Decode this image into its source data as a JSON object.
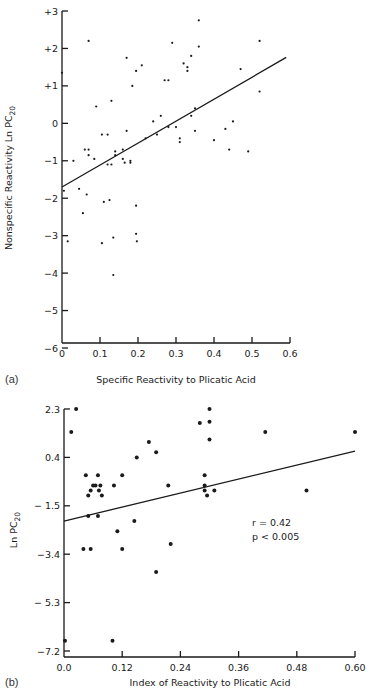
{
  "chart_data": [
    {
      "type": "scatter",
      "panel": "(a)",
      "title": "",
      "xlabel": "Specific Reactivity to Plicatic Acid",
      "ylabel": "Nonspecific Reactivity Ln PC20",
      "ylabel_main": "Nonspecific Reactivity Ln PC",
      "ylabel_sub": "20",
      "xlim": [
        0,
        0.6
      ],
      "ylim": [
        -6,
        3
      ],
      "x_ticks": [
        0,
        0.1,
        0.2,
        0.3,
        0.4,
        0.5,
        0.6
      ],
      "x_tick_labels": [
        "0",
        "0.1",
        "0.2",
        "0.3",
        "0.4",
        "0.5",
        "0.6"
      ],
      "y_ticks": [
        3,
        2,
        1,
        0,
        -1,
        -2,
        -3,
        -4,
        -5,
        -6
      ],
      "y_tick_labels": [
        "+3",
        "+2",
        "+1",
        "0",
        "−1",
        "−2",
        "−3",
        "−4",
        "−5",
        "−6"
      ],
      "grid": false,
      "fit_line": {
        "x": [
          0,
          0.59
        ],
        "y": [
          -1.7,
          1.76
        ]
      },
      "points": [
        {
          "x": 0.0,
          "y": 1.35
        },
        {
          "x": 0.07,
          "y": 2.2
        },
        {
          "x": 0.03,
          "y": -1.0
        },
        {
          "x": 0.06,
          "y": -0.7
        },
        {
          "x": 0.07,
          "y": -0.7
        },
        {
          "x": 0.07,
          "y": -0.85
        },
        {
          "x": 0.085,
          "y": -0.95
        },
        {
          "x": 0.09,
          "y": 0.45
        },
        {
          "x": 0.105,
          "y": -0.3
        },
        {
          "x": 0.12,
          "y": -0.3
        },
        {
          "x": 0.13,
          "y": 0.6
        },
        {
          "x": 0.14,
          "y": -0.75
        },
        {
          "x": 0.14,
          "y": -0.85
        },
        {
          "x": 0.16,
          "y": -0.7
        },
        {
          "x": 0.16,
          "y": -0.95
        },
        {
          "x": 0.165,
          "y": -1.05
        },
        {
          "x": 0.17,
          "y": 1.75
        },
        {
          "x": 0.17,
          "y": -0.2
        },
        {
          "x": 0.18,
          "y": -1.05
        },
        {
          "x": 0.185,
          "y": 1.0
        },
        {
          "x": 0.195,
          "y": 1.4
        },
        {
          "x": 0.21,
          "y": 1.55
        },
        {
          "x": 0.13,
          "y": -1.1
        },
        {
          "x": 0.12,
          "y": -1.1
        },
        {
          "x": 0.18,
          "y": -1.0
        },
        {
          "x": 0.22,
          "y": -0.4
        },
        {
          "x": 0.24,
          "y": 0.05
        },
        {
          "x": 0.25,
          "y": -0.3
        },
        {
          "x": 0.26,
          "y": 0.2
        },
        {
          "x": 0.27,
          "y": 1.15
        },
        {
          "x": 0.28,
          "y": 1.15
        },
        {
          "x": 0.28,
          "y": -0.1
        },
        {
          "x": 0.29,
          "y": 2.15
        },
        {
          "x": 0.3,
          "y": -0.1
        },
        {
          "x": 0.31,
          "y": -0.4
        },
        {
          "x": 0.31,
          "y": -0.5
        },
        {
          "x": 0.32,
          "y": 1.6
        },
        {
          "x": 0.33,
          "y": 1.5
        },
        {
          "x": 0.33,
          "y": 1.4
        },
        {
          "x": 0.34,
          "y": 1.8
        },
        {
          "x": 0.36,
          "y": 2.75
        },
        {
          "x": 0.36,
          "y": 2.05
        },
        {
          "x": 0.35,
          "y": 0.4
        },
        {
          "x": 0.34,
          "y": 0.2
        },
        {
          "x": 0.35,
          "y": -0.2
        },
        {
          "x": 0.4,
          "y": -0.45
        },
        {
          "x": 0.43,
          "y": -0.15
        },
        {
          "x": 0.45,
          "y": 0.05
        },
        {
          "x": 0.52,
          "y": 2.2
        },
        {
          "x": 0.52,
          "y": 0.85
        },
        {
          "x": 0.49,
          "y": -0.75
        },
        {
          "x": 0.44,
          "y": -0.7
        },
        {
          "x": 0.47,
          "y": 1.45
        },
        {
          "x": 0.005,
          "y": -1.8
        },
        {
          "x": 0.045,
          "y": -1.75
        },
        {
          "x": 0.055,
          "y": -2.4
        },
        {
          "x": 0.065,
          "y": -1.9
        },
        {
          "x": 0.11,
          "y": -2.1
        },
        {
          "x": 0.125,
          "y": -2.05
        },
        {
          "x": 0.195,
          "y": -2.2
        },
        {
          "x": 0.015,
          "y": -3.15
        },
        {
          "x": 0.105,
          "y": -3.2
        },
        {
          "x": 0.135,
          "y": -3.05
        },
        {
          "x": 0.195,
          "y": -2.95
        },
        {
          "x": 0.197,
          "y": -3.15
        },
        {
          "x": 0.135,
          "y": -4.05
        }
      ]
    },
    {
      "type": "scatter",
      "panel": "(b)",
      "title": "",
      "xlabel": "Index of Reactivity to Plicatic Acid",
      "ylabel": "Ln PC20",
      "ylabel_main": "Ln PC",
      "ylabel_sub": "20",
      "xlim": [
        0,
        0.6
      ],
      "ylim": [
        -7.2,
        2.3
      ],
      "x_ticks": [
        0.0,
        0.12,
        0.24,
        0.36,
        0.48,
        0.6
      ],
      "x_tick_labels": [
        "0.0",
        "0.12",
        "0.24",
        "0.36",
        "0.48",
        "0.60"
      ],
      "y_ticks": [
        2.3,
        0.4,
        -1.5,
        -3.4,
        -5.3,
        -7.2
      ],
      "y_tick_labels": [
        "2.3",
        "0.4",
        "− 1.5",
        "−3.4",
        "− 5.3",
        "−7.2"
      ],
      "grid": false,
      "annotation": {
        "r": "r = 0.42",
        "p": "p < 0.005"
      },
      "fit_line": {
        "x": [
          0,
          0.6
        ],
        "y": [
          -2.1,
          0.65
        ]
      },
      "points": [
        {
          "x": 0.025,
          "y": 2.3
        },
        {
          "x": 0.015,
          "y": 1.4
        },
        {
          "x": 0.15,
          "y": 0.4
        },
        {
          "x": 0.19,
          "y": 0.6
        },
        {
          "x": 0.175,
          "y": 1.0
        },
        {
          "x": 0.045,
          "y": -0.3
        },
        {
          "x": 0.07,
          "y": -0.3
        },
        {
          "x": 0.12,
          "y": -0.3
        },
        {
          "x": 0.06,
          "y": -0.7
        },
        {
          "x": 0.065,
          "y": -0.7
        },
        {
          "x": 0.075,
          "y": -0.7
        },
        {
          "x": 0.055,
          "y": -0.9
        },
        {
          "x": 0.072,
          "y": -0.9
        },
        {
          "x": 0.05,
          "y": -1.1
        },
        {
          "x": 0.078,
          "y": -1.1
        },
        {
          "x": 0.103,
          "y": -0.7
        },
        {
          "x": 0.215,
          "y": -0.7
        },
        {
          "x": 0.28,
          "y": 1.75
        },
        {
          "x": 0.3,
          "y": 2.3
        },
        {
          "x": 0.3,
          "y": 1.1
        },
        {
          "x": 0.3,
          "y": 1.8
        },
        {
          "x": 0.415,
          "y": 1.4
        },
        {
          "x": 0.6,
          "y": 1.4
        },
        {
          "x": 0.29,
          "y": -0.3
        },
        {
          "x": 0.29,
          "y": -0.7
        },
        {
          "x": 0.29,
          "y": -0.9
        },
        {
          "x": 0.295,
          "y": -1.1
        },
        {
          "x": 0.31,
          "y": -0.9
        },
        {
          "x": 0.5,
          "y": -0.9
        },
        {
          "x": 0.05,
          "y": -1.9
        },
        {
          "x": 0.07,
          "y": -1.9
        },
        {
          "x": 0.11,
          "y": -2.5
        },
        {
          "x": 0.145,
          "y": -2.1
        },
        {
          "x": 0.04,
          "y": -3.2
        },
        {
          "x": 0.055,
          "y": -3.2
        },
        {
          "x": 0.12,
          "y": -3.2
        },
        {
          "x": 0.22,
          "y": -3.0
        },
        {
          "x": 0.19,
          "y": -4.1
        },
        {
          "x": 0.002,
          "y": -6.8
        },
        {
          "x": 0.1,
          "y": -6.8
        }
      ]
    }
  ]
}
